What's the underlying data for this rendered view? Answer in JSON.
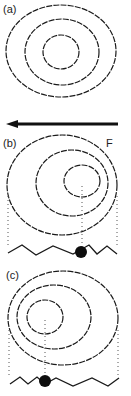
{
  "figure": {
    "panels": [
      {
        "id": "a",
        "label": "(a)"
      },
      {
        "id": "b",
        "label": "(b)",
        "force_label": "F"
      },
      {
        "id": "c",
        "label": "(c)"
      }
    ],
    "arrow": {
      "direction": "left",
      "label": "F"
    },
    "colors": {
      "ink": "#1a1a1a",
      "guide": "#555555",
      "background": "#ffffff"
    }
  }
}
